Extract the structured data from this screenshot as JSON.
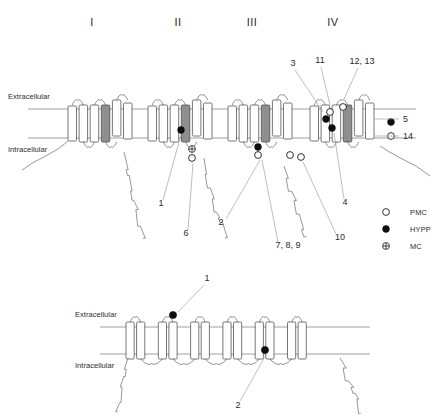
{
  "figure": {
    "type": "diagram",
    "panels": [
      {
        "id": "upper",
        "channel": "sodium-channel",
        "domain_labels": [
          "I",
          "II",
          "III",
          "IV"
        ],
        "domain_label_x": [
          92,
          178,
          252,
          333
        ],
        "domain_label_y": 26,
        "membrane": {
          "extracellular_label": "Extracellular",
          "intracellular_label": "Intracellular",
          "extracellular_y": 109,
          "intracellular_y": 138,
          "extracellular_label_xy": [
            8,
            99
          ],
          "intracellular_label_xy": [
            8,
            152
          ]
        },
        "domains": [
          {
            "numeral": "I",
            "x": 68,
            "segments": 6,
            "s4_index": 4
          },
          {
            "numeral": "II",
            "x": 148,
            "segments": 6,
            "s4_index": 4
          },
          {
            "numeral": "III",
            "x": 228,
            "segments": 6,
            "s4_index": 4
          },
          {
            "numeral": "IV",
            "x": 310,
            "segments": 6,
            "s4_index": 4
          }
        ],
        "markers": [
          {
            "id": "m1",
            "type": "HYPP",
            "symbol": "filled",
            "x": 326,
            "y": 119
          },
          {
            "id": "m2",
            "type": "HYPP",
            "symbol": "filled",
            "x": 181,
            "y": 130
          },
          {
            "id": "m3",
            "type": "HYPP",
            "symbol": "filled",
            "x": 258,
            "y": 147
          },
          {
            "id": "m4",
            "type": "HYPP",
            "symbol": "filled",
            "x": 332,
            "y": 128
          },
          {
            "id": "m5",
            "type": "PMC",
            "symbol": "open",
            "x": 343,
            "y": 107
          },
          {
            "id": "m6",
            "type": "PMC",
            "symbol": "open",
            "x": 330,
            "y": 112
          },
          {
            "id": "m7",
            "type": "HYPP",
            "symbol": "filled",
            "x": 391,
            "y": 122
          },
          {
            "id": "m8",
            "type": "PMC",
            "symbol": "open",
            "x": 391,
            "y": 136
          },
          {
            "id": "m9",
            "type": "PMC",
            "symbol": "open",
            "x": 258,
            "y": 155
          },
          {
            "id": "m10",
            "type": "PMC",
            "symbol": "open",
            "x": 290,
            "y": 155
          },
          {
            "id": "m11",
            "type": "PMC",
            "symbol": "open",
            "x": 301,
            "y": 157
          },
          {
            "id": "m12",
            "type": "PMC",
            "symbol": "open",
            "x": 192,
            "y": 158
          },
          {
            "id": "m13",
            "type": "MC",
            "symbol": "cross",
            "x": 192,
            "y": 149
          }
        ],
        "callouts": [
          {
            "label": "3",
            "x": 293,
            "y": 66,
            "anchor": "middle",
            "line": [
              [
                295,
                70
              ],
              [
                323,
                112
              ]
            ]
          },
          {
            "label": "11",
            "x": 320,
            "y": 63,
            "anchor": "middle",
            "line": [
              [
                321,
                67
              ],
              [
                330,
                105
              ]
            ]
          },
          {
            "label": "12, 13",
            "x": 362,
            "y": 64,
            "anchor": "middle",
            "line": [
              [
                358,
                68
              ],
              [
                344,
                99
              ]
            ]
          },
          {
            "label": "5",
            "x": 403,
            "y": 122,
            "anchor": "start",
            "line": [
              [
                399,
                119
              ],
              [
                375,
                119
              ]
            ]
          },
          {
            "label": "14",
            "x": 403,
            "y": 139,
            "anchor": "start",
            "line": [
              [
                399,
                136
              ],
              [
                375,
                136
              ]
            ]
          },
          {
            "label": "1",
            "x": 161,
            "y": 206,
            "anchor": "middle",
            "line": [
              [
                163,
                200
              ],
              [
                181,
                135
              ]
            ]
          },
          {
            "label": "6",
            "x": 186,
            "y": 236,
            "anchor": "middle",
            "line": [
              [
                188,
                230
              ],
              [
                193,
                163
              ]
            ]
          },
          {
            "label": "2",
            "x": 221,
            "y": 225,
            "anchor": "middle",
            "line": [
              [
                226,
                219
              ],
              [
                260,
                160
              ]
            ]
          },
          {
            "label": "7, 8, 9",
            "x": 288,
            "y": 248,
            "anchor": "middle",
            "line": [
              [
                278,
                242
              ],
              [
                262,
                160
              ]
            ]
          },
          {
            "label": "10",
            "x": 340,
            "y": 240,
            "anchor": "middle",
            "line": [
              [
                336,
                234
              ],
              [
                303,
                162
              ]
            ]
          },
          {
            "label": "4",
            "x": 345,
            "y": 205,
            "anchor": "middle",
            "line": [
              [
                344,
                199
              ],
              [
                334,
                133
              ]
            ]
          }
        ]
      },
      {
        "id": "lower",
        "channel": "chloride-channel",
        "membrane": {
          "extracellular_label": "Extracellular",
          "intracellular_label": "Intracellular",
          "extracellular_y": 327,
          "intracellular_y": 354,
          "extracellular_label_xy": [
            75,
            317
          ],
          "intracellular_label_xy": [
            75,
            368
          ]
        },
        "segments": 12,
        "markers": [
          {
            "id": "l1",
            "type": "HYPP",
            "symbol": "filled",
            "x": 173,
            "y": 315
          },
          {
            "id": "l2",
            "type": "HYPP",
            "symbol": "filled",
            "x": 265,
            "y": 350
          }
        ],
        "callouts": [
          {
            "label": "1",
            "x": 207,
            "y": 281,
            "anchor": "middle",
            "line": [
              [
                204,
                285
              ],
              [
                178,
                312
              ]
            ]
          },
          {
            "label": "2",
            "x": 238,
            "y": 408,
            "anchor": "middle",
            "line": [
              [
                240,
                401
              ],
              [
                266,
                355
              ]
            ]
          }
        ]
      }
    ],
    "legend": {
      "x": 386,
      "items": [
        {
          "symbol": "open",
          "label": "PMC",
          "y": 212
        },
        {
          "symbol": "filled",
          "label": "HYPP",
          "y": 229
        },
        {
          "symbol": "cross",
          "label": "MC",
          "y": 246
        }
      ]
    }
  }
}
